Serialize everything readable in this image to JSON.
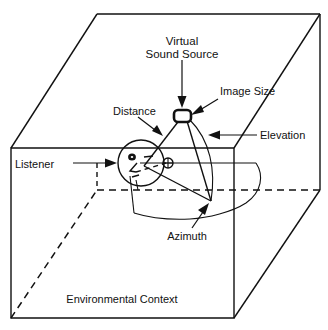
{
  "figure": {
    "title_implicit": "Virtual acoustic display spatial cue diagram",
    "background_color": "#ffffff",
    "ink_color": "#111111",
    "labels": {
      "virtual_sound_source_line1": "Virtual",
      "virtual_sound_source_line2": "Sound Source",
      "image_size": "Image Size",
      "distance": "Distance",
      "elevation": "Elevation",
      "listener": "Listener",
      "azimuth": "Azimuth",
      "environmental_context": "Environmental Context"
    },
    "annotations": [
      {
        "name": "virtual-sound-source",
        "text": "Virtual Sound Source",
        "points_to": "sound source marker at top of distance vector",
        "leader": "vertical arrow pointing down"
      },
      {
        "name": "image-size",
        "text": "Image Size",
        "points_to": "rounded rectangle marker representing source extent",
        "leader": "diagonal arrow pointing down-left"
      },
      {
        "name": "distance",
        "text": "Distance",
        "points_to": "line segment from listener head to sound source",
        "leader": "diagonal arrow pointing down-right"
      },
      {
        "name": "elevation",
        "text": "Elevation",
        "points_to": "vertical arc between horizontal plane and source",
        "leader": "horizontal arrow pointing left"
      },
      {
        "name": "listener",
        "text": "Listener",
        "points_to": "head drawn in profile at centre of coordinate system",
        "leader": "horizontal arrow pointing right"
      },
      {
        "name": "azimuth",
        "text": "Azimuth",
        "points_to": "arc on the horizontal plane beneath the source",
        "leader": "diagonal arrow pointing up-right"
      },
      {
        "name": "environmental-context",
        "text": "Environmental Context",
        "points_to": "enclosing wireframe room/box",
        "leader": "none"
      }
    ],
    "geometry": {
      "box_description": "Open wireframe room in oblique projection: solid front-left face, solid top-back edges, dashed hidden floor edges.",
      "elements": [
        "listener head profile circle",
        "horizontal azimuth reference plane",
        "elevation arc",
        "distance vector",
        "sound source image-size marker"
      ]
    }
  }
}
